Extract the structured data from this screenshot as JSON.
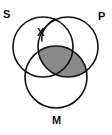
{
  "figure": {
    "kind": "venn-diagram",
    "background_color": "#ffffff",
    "stroke_color": "#111111",
    "shade_color": "#8a8a8a",
    "circle_fill": "#ffffff"
  },
  "labels": {
    "s": "S",
    "p": "P",
    "m": "M",
    "x": "X"
  },
  "circles": [
    {
      "name": "S",
      "label": "S",
      "cx": 43,
      "cy": 47,
      "r": 30
    },
    {
      "name": "P",
      "label": "P",
      "cx": 68,
      "cy": 47,
      "r": 30
    },
    {
      "name": "M",
      "label": "M",
      "cx": 56,
      "cy": 77,
      "r": 31
    }
  ],
  "shaded_regions": [
    {
      "name": "p-intersect-m",
      "description": "lens-shaped overlap of circle P and circle M",
      "fill": "#8a8a8a"
    }
  ],
  "annotations": [
    {
      "name": "x-marker",
      "label": "X",
      "points_to": "top intersection of circles S and P",
      "leader_line": true
    }
  ]
}
